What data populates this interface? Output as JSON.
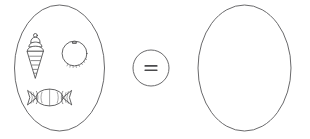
{
  "diagram": {
    "type": "set-equation-worksheet",
    "title": "",
    "equation_text": "=",
    "left_set": {
      "label": "",
      "shape": "ellipse",
      "item_count": 3,
      "items": [
        {
          "name": "ice-cream-cone",
          "icon": "ice-cream-cone-icon",
          "label": ""
        },
        {
          "name": "round-candy",
          "icon": "round-candy-icon",
          "label": ""
        },
        {
          "name": "wrapped-candy",
          "icon": "wrapped-candy-icon",
          "label": ""
        }
      ]
    },
    "operator": {
      "name": "equals",
      "symbol": "=",
      "shape": "circle"
    },
    "right_set": {
      "label": "",
      "shape": "ellipse",
      "item_count": 0,
      "items": [],
      "state": "empty"
    },
    "colors": {
      "background": "#ffffff",
      "outline": "#58585a",
      "item_stroke": "#3c3c3e",
      "operator": "#4a4a4c"
    }
  }
}
